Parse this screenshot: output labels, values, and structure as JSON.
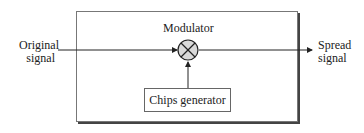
{
  "diagram": {
    "input_label_line1": "Original",
    "input_label_line2": "signal",
    "output_label_line1": "Spread",
    "output_label_line2": "signal",
    "modulator_label": "Modulator",
    "multiplier_symbol": "multiplication-circle",
    "chips_generator_label": "Chips generator",
    "colors": {
      "line": "#222222",
      "circle_fill": "#d9d9d9",
      "box_border": "#777777"
    }
  }
}
